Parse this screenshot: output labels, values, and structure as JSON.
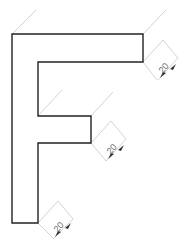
{
  "figure": {
    "shape_letter": "F",
    "outline_color": "#222222",
    "dimension_color": "#bbbbbb",
    "arrow_color": "#333333",
    "text_color": "#666666"
  },
  "dimensions": [
    {
      "id": "top-arm",
      "label": "20"
    },
    {
      "id": "middle-arm",
      "label": "20"
    },
    {
      "id": "stem",
      "label": "20"
    }
  ]
}
